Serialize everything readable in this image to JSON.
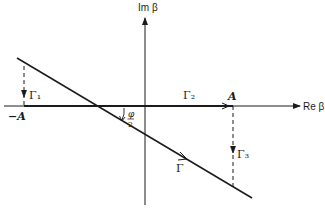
{
  "diagram": {
    "axes": {
      "imag_label": "Im β",
      "real_label": "Re β"
    },
    "points": {
      "neg_A": "−A",
      "A": "A"
    },
    "contours": {
      "gamma1": "Γ₁",
      "gamma2": "Γ₂",
      "gamma3": "Γ₃",
      "gamma": "Γ"
    },
    "angle": {
      "numerator": "φ",
      "denominator": "2"
    },
    "colors": {
      "ink": "#1a1a1a",
      "background": "#ffffff"
    }
  }
}
